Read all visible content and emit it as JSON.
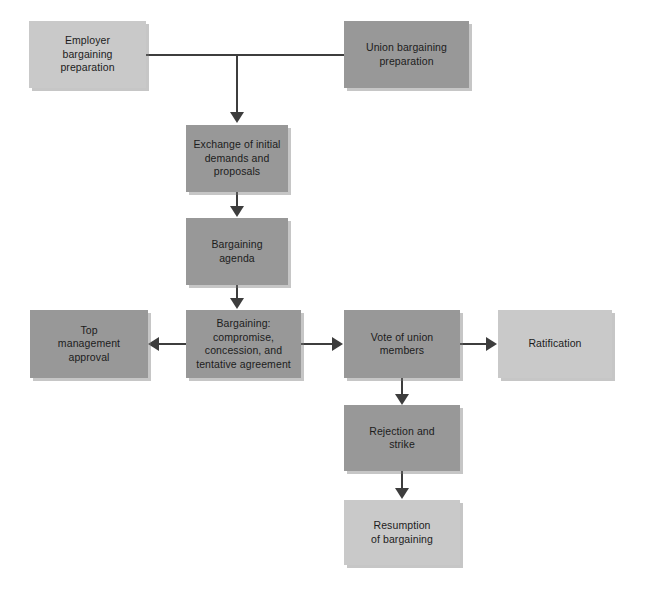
{
  "diagram": {
    "colors": {
      "light_box": "#c9c9c9",
      "mid_box": "#989898",
      "connector": "#3d3d3d",
      "text": "#1c1c1c",
      "background": "#ffffff"
    },
    "nodes": [
      {
        "id": "employer-preparation",
        "label": "Employer\nbargaining\npreparation",
        "tone": "light",
        "x": 29,
        "y": 21,
        "w": 117,
        "h": 67
      },
      {
        "id": "union-preparation",
        "label": "Union bargaining\npreparation",
        "tone": "mid",
        "x": 344,
        "y": 21,
        "w": 125,
        "h": 67
      },
      {
        "id": "exchange-of-initial-demands",
        "label": "Exchange of initial\ndemands and\nproposals",
        "tone": "mid",
        "x": 186,
        "y": 125,
        "w": 102,
        "h": 67
      },
      {
        "id": "bargaining-agenda",
        "label": "Bargaining\nagenda",
        "tone": "mid",
        "x": 186,
        "y": 218,
        "w": 102,
        "h": 67
      },
      {
        "id": "top-management-approval",
        "label": "Top\nmanagement\napproval",
        "tone": "mid",
        "x": 30,
        "y": 310,
        "w": 118,
        "h": 68
      },
      {
        "id": "bargaining-compromise",
        "label": "Bargaining:\ncompromise,\nconcession, and\ntentative agreement",
        "tone": "mid",
        "x": 186,
        "y": 310,
        "w": 115,
        "h": 68
      },
      {
        "id": "vote-of-union-members",
        "label": "Vote of union\nmembers",
        "tone": "mid",
        "x": 344,
        "y": 310,
        "w": 116,
        "h": 68
      },
      {
        "id": "ratification",
        "label": "Ratification",
        "tone": "light",
        "x": 498,
        "y": 310,
        "w": 114,
        "h": 68
      },
      {
        "id": "rejection-and-strike",
        "label": "Rejection and\nstrike",
        "tone": "mid",
        "x": 344,
        "y": 405,
        "w": 116,
        "h": 66
      },
      {
        "id": "resumption-of-bargaining",
        "label": "Resumption\nof bargaining",
        "tone": "light",
        "x": 344,
        "y": 500,
        "w": 116,
        "h": 65
      }
    ]
  }
}
